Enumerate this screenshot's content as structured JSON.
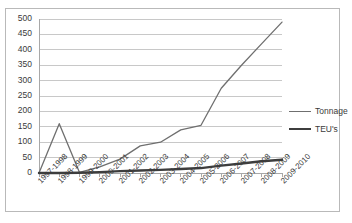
{
  "chart_data": {
    "type": "line",
    "title": "",
    "xlabel": "",
    "ylabel": "",
    "ylim": [
      0,
      500
    ],
    "ytick_step": 50,
    "yticks": [
      500,
      450,
      400,
      350,
      300,
      250,
      200,
      150,
      100,
      50,
      0
    ],
    "grid": true,
    "legend_position": "right",
    "categories": [
      "1997-1998",
      "1998-1999",
      "1999-2000",
      "2000-2001",
      "2001-2002",
      "2002-2003",
      "2003-2004",
      "2004-2005",
      "2005-2006",
      "2006-2007",
      "2007-2008",
      "2008-2009",
      "2009-2010"
    ],
    "series": [
      {
        "name": "Tonnage",
        "color": "#6f6f6f",
        "width": 1.3,
        "values": [
          0,
          160,
          2,
          20,
          45,
          88,
          100,
          140,
          155,
          275,
          350,
          420,
          490
        ]
      },
      {
        "name": "TEU's",
        "color": "#3d3d3d",
        "width": 2.4,
        "values": [
          0,
          0,
          1,
          3,
          6,
          8,
          10,
          13,
          16,
          24,
          31,
          38,
          43
        ]
      }
    ]
  },
  "legend": {
    "items": [
      {
        "label": "Tonnage"
      },
      {
        "label": "TEU's"
      }
    ]
  },
  "colors": {
    "frame": "#b9b9b9",
    "grid": "#c8c8c8",
    "axis": "#a8a8a8",
    "tonnage": "#6f6f6f",
    "teus": "#3d3d3d",
    "text": "#3a3a3a"
  }
}
